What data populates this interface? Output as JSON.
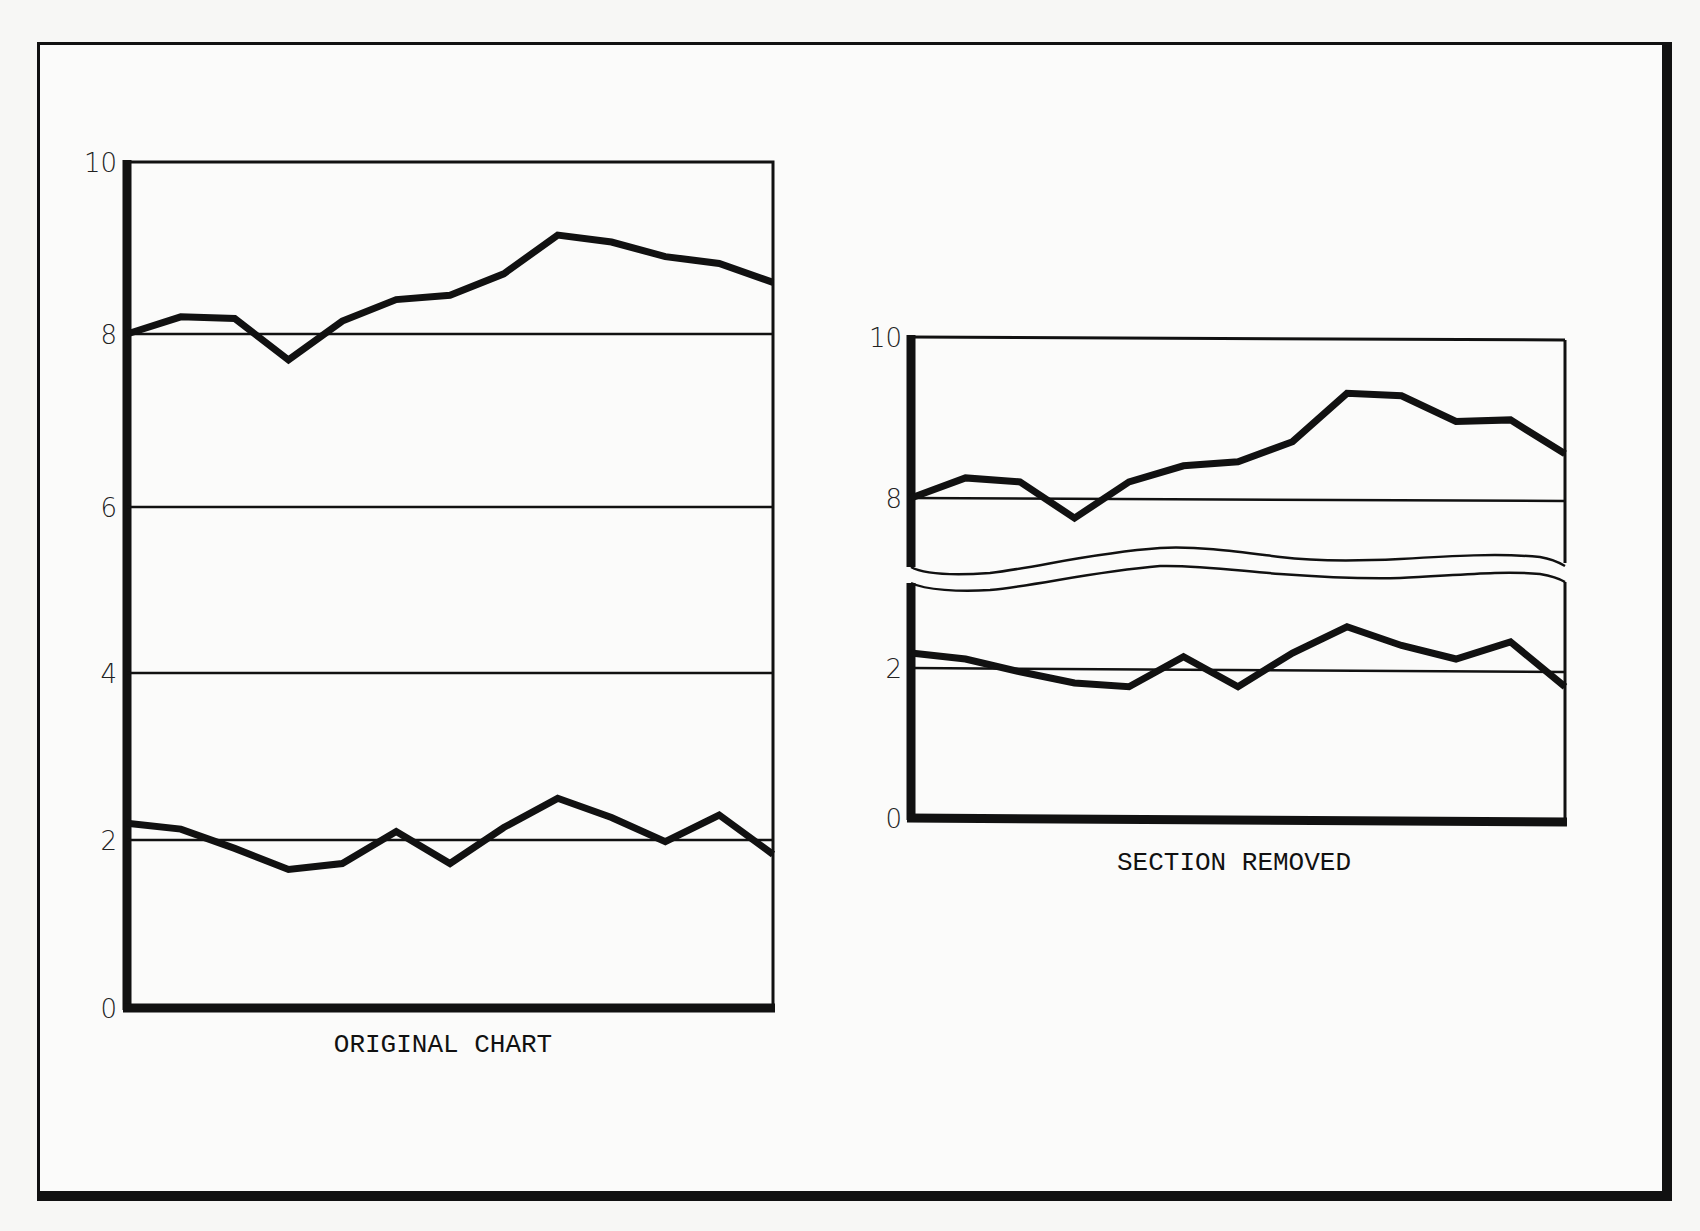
{
  "chart_data": [
    {
      "type": "line",
      "title": "ORIGINAL CHART",
      "xlabel": "",
      "ylabel": "",
      "ylim": [
        0,
        10
      ],
      "y_ticks": [
        "0",
        "2",
        "4",
        "6",
        "8",
        "10"
      ],
      "grid": "horizontal lines at 2, 4, 6, 8",
      "axis_break": false,
      "x": [
        1,
        2,
        3,
        4,
        5,
        6,
        7,
        8,
        9,
        10,
        11,
        12,
        13
      ],
      "series": [
        {
          "name": "upper",
          "values": [
            8.0,
            8.2,
            8.18,
            7.7,
            8.15,
            8.4,
            8.45,
            8.7,
            9.15,
            9.07,
            8.9,
            8.82,
            8.6
          ]
        },
        {
          "name": "lower",
          "values": [
            2.2,
            2.13,
            1.9,
            1.65,
            1.72,
            2.1,
            1.72,
            2.15,
            2.5,
            2.27,
            1.98,
            2.3,
            1.83
          ]
        }
      ]
    },
    {
      "type": "line",
      "title": "SECTION REMOVED",
      "xlabel": "",
      "ylabel": "",
      "ylim": [
        0,
        10
      ],
      "y_ticks": [
        "0",
        "2",
        "8",
        "10"
      ],
      "grid": "horizontal lines at 2 and 8",
      "axis_break": true,
      "axis_break_range": [
        3,
        7
      ],
      "x": [
        1,
        2,
        3,
        4,
        5,
        6,
        7,
        8,
        9,
        10,
        11,
        12,
        13
      ],
      "series": [
        {
          "name": "upper",
          "values": [
            8.0,
            8.25,
            8.2,
            7.75,
            8.2,
            8.4,
            8.45,
            8.7,
            9.3,
            9.27,
            8.95,
            8.97,
            8.55
          ]
        },
        {
          "name": "lower",
          "values": [
            2.2,
            2.12,
            1.95,
            1.8,
            1.75,
            2.15,
            1.75,
            2.2,
            2.55,
            2.3,
            2.12,
            2.35,
            1.75
          ]
        }
      ]
    }
  ],
  "labels": {
    "left_caption": "ORIGINAL CHART",
    "right_caption": "SECTION REMOVED",
    "left_ticks": [
      "10",
      "8",
      "6",
      "4",
      "2",
      "0"
    ],
    "right_ticks": [
      "10",
      "8",
      "2",
      "0"
    ]
  },
  "colors": {
    "ink": "#111111",
    "paper": "#fbfbfa"
  }
}
